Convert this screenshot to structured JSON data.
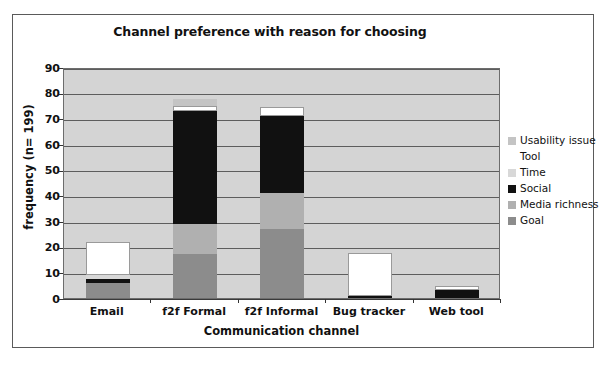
{
  "chart_data": {
    "type": "bar",
    "subtype": "stacked-bar",
    "title": "Channel preference with reason for choosing",
    "xlabel": "Communication channel",
    "ylabel": "frequency (n= 199)",
    "categories": [
      "Email",
      "f2f Formal",
      "f2f Informal",
      "Bug tracker",
      "Web tool"
    ],
    "ylim": [
      0,
      90
    ],
    "yticks": [
      0,
      10,
      20,
      30,
      40,
      50,
      60,
      70,
      80,
      90
    ],
    "grid": true,
    "legend_position": "right",
    "plot_background": "#d4d4d4",
    "series": [
      {
        "name": "Goal",
        "color": "#8c8c8c",
        "values": [
          6,
          17,
          27,
          0,
          0
        ]
      },
      {
        "name": "Media richness",
        "color": "#b0b0b0",
        "values": [
          0,
          12,
          14,
          0,
          0
        ]
      },
      {
        "name": "Social",
        "color": "#111111",
        "values": [
          1.5,
          44,
          30,
          0.7,
          3
        ]
      },
      {
        "name": "Time",
        "color": "#d8d8d8",
        "values": [
          1.5,
          0,
          0,
          0,
          0
        ]
      },
      {
        "name": "Tool",
        "color": "#ffffff",
        "values": [
          13,
          2,
          3.5,
          16.8,
          1.5
        ]
      },
      {
        "name": "Usability issue",
        "color": "#c4c4c4",
        "values": [
          0,
          2.5,
          0,
          0,
          0
        ]
      }
    ],
    "totals": [
      22,
      77.5,
      74.5,
      17.5,
      4.5
    ]
  },
  "legend": {
    "entries": [
      {
        "label": "Usability issue",
        "color": "#c4c4c4"
      },
      {
        "label": "Tool",
        "color": "#ffffff"
      },
      {
        "label": "Time",
        "color": "#d8d8d8"
      },
      {
        "label": "Social",
        "color": "#111111"
      },
      {
        "label": "Media richness",
        "color": "#b0b0b0"
      },
      {
        "label": "Goal",
        "color": "#8c8c8c"
      }
    ]
  }
}
